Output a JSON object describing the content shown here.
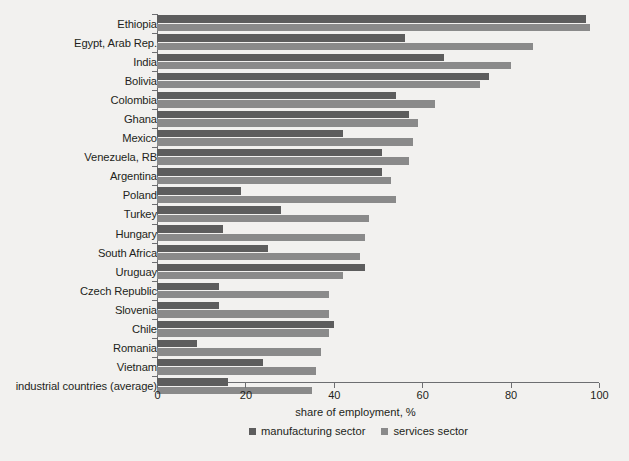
{
  "chart_data": {
    "type": "bar",
    "orientation": "horizontal",
    "title": "",
    "xlabel": "share of employment, %",
    "ylabel": "",
    "xlim": [
      0,
      100
    ],
    "xticks": [
      0,
      20,
      40,
      60,
      80,
      100
    ],
    "grid": false,
    "legend_position": "bottom-center",
    "categories": [
      "Ethiopia",
      "Egypt, Arab Rep.",
      "India",
      "Bolivia",
      "Colombia",
      "Ghana",
      "Mexico",
      "Venezuela, RB",
      "Argentina",
      "Poland",
      "Turkey",
      "Hungary",
      "South Africa",
      "Uruguay",
      "Czech Republic",
      "Slovenia",
      "Chile",
      "Romania",
      "Vietnam",
      "industrial countries (average)"
    ],
    "series": [
      {
        "name": "manufacturing sector",
        "color": "#5d5d5d",
        "values": [
          97,
          56,
          65,
          75,
          54,
          57,
          42,
          51,
          51,
          19,
          28,
          15,
          25,
          47,
          14,
          14,
          40,
          9,
          24,
          16
        ]
      },
      {
        "name": "services sector",
        "color": "#8a8a8a",
        "values": [
          98,
          85,
          80,
          73,
          63,
          59,
          58,
          57,
          53,
          54,
          48,
          47,
          46,
          42,
          39,
          39,
          39,
          37,
          36,
          35
        ]
      }
    ]
  },
  "legend": {
    "items": [
      {
        "label": "manufacturing sector",
        "swatch": "manufacturing"
      },
      {
        "label": "services sector",
        "swatch": "services"
      }
    ]
  },
  "axis": {
    "x_title": "share of employment, %",
    "tick_labels": [
      "0",
      "20",
      "40",
      "60",
      "80",
      "100"
    ]
  },
  "colors": {
    "manufacturing": "#5d5d5d",
    "services": "#8a8a8a",
    "axis": "#6d6e71",
    "text": "#231f20",
    "background": "#f2f1ef"
  }
}
